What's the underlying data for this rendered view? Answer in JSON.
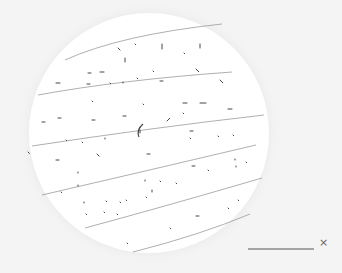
{
  "scene": {
    "background": "#f4f4f4",
    "field": {
      "cx": 149,
      "cy": 133,
      "r": 120,
      "fill": "#ffffff",
      "halo": "#e2e2e2"
    },
    "fibers": [
      {
        "d": "M65 60 Q 120 35 222 24"
      },
      {
        "d": "M38 95 Q 120 80 232 72"
      },
      {
        "d": "M32 146 Q 150 128 264 115"
      },
      {
        "d": "M42 195 Q 150 170 256 145"
      },
      {
        "d": "M85 228 Q 170 205 262 178"
      },
      {
        "d": "M133 252 Q 200 235 250 214"
      }
    ],
    "fiber_color": "#9a9a9a",
    "specks": [
      [
        118,
        48,
        3,
        1
      ],
      [
        135,
        44,
        1,
        1
      ],
      [
        162,
        44,
        5,
        2
      ],
      [
        200,
        44,
        4,
        2
      ],
      [
        125,
        58,
        4,
        2
      ],
      [
        184,
        53,
        1,
        1
      ],
      [
        196,
        69,
        4,
        1
      ],
      [
        88,
        73,
        3,
        0
      ],
      [
        100,
        72,
        4,
        0
      ],
      [
        153,
        71,
        1,
        1
      ],
      [
        56,
        83,
        4,
        0
      ],
      [
        87,
        84,
        3,
        0
      ],
      [
        110,
        83,
        1,
        1
      ],
      [
        123,
        82,
        1,
        2
      ],
      [
        137,
        78,
        1,
        1
      ],
      [
        160,
        81,
        3,
        0
      ],
      [
        220,
        80,
        4,
        1
      ],
      [
        92,
        101,
        1,
        1
      ],
      [
        143,
        104,
        1,
        1
      ],
      [
        183,
        103,
        4,
        0
      ],
      [
        200,
        103,
        6,
        0
      ],
      [
        228,
        109,
        4,
        0
      ],
      [
        42,
        122,
        3,
        0
      ],
      [
        58,
        118,
        3,
        0
      ],
      [
        92,
        120,
        3,
        0
      ],
      [
        123,
        116,
        3,
        0
      ],
      [
        183,
        113,
        1,
        1
      ],
      [
        167,
        121,
        4,
        -1
      ],
      [
        140,
        130,
        3,
        2
      ],
      [
        105,
        138,
        1,
        2
      ],
      [
        66,
        140,
        1,
        1
      ],
      [
        82,
        142,
        1,
        1
      ],
      [
        190,
        131,
        3,
        0
      ],
      [
        190,
        138,
        1,
        1
      ],
      [
        218,
        136,
        1,
        1
      ],
      [
        233,
        135,
        1,
        1
      ],
      [
        28,
        152,
        2,
        1
      ],
      [
        97,
        154,
        3,
        1
      ],
      [
        147,
        154,
        3,
        0
      ],
      [
        56,
        160,
        3,
        0
      ],
      [
        192,
        166,
        3,
        0
      ],
      [
        208,
        170,
        1,
        1
      ],
      [
        235,
        159,
        1,
        2
      ],
      [
        236,
        166,
        1,
        2
      ],
      [
        246,
        162,
        1,
        1
      ],
      [
        78,
        172,
        1,
        2
      ],
      [
        78,
        185,
        1,
        2
      ],
      [
        145,
        180,
        1,
        2
      ],
      [
        160,
        181,
        1,
        1
      ],
      [
        176,
        183,
        1,
        1
      ],
      [
        61,
        192,
        1,
        1
      ],
      [
        152,
        190,
        2,
        2
      ],
      [
        146,
        197,
        1,
        1
      ],
      [
        84,
        202,
        1,
        2
      ],
      [
        106,
        201,
        1,
        1
      ],
      [
        120,
        202,
        1,
        1
      ],
      [
        126,
        200,
        1,
        1
      ],
      [
        104,
        212,
        1,
        1
      ],
      [
        117,
        214,
        1,
        1
      ],
      [
        86,
        214,
        1,
        1
      ],
      [
        196,
        216,
        3,
        0
      ],
      [
        228,
        208,
        1,
        1
      ],
      [
        238,
        200,
        1,
        1
      ],
      [
        170,
        228,
        1,
        1
      ],
      [
        127,
        243,
        1,
        1
      ]
    ],
    "speck_color": "#444444",
    "curl": {
      "d": "M143 124 Q 136 130 139 137"
    }
  },
  "scale_bar": {
    "x1": 248,
    "x2": 314,
    "y": 249,
    "color": "#555555",
    "label": "×"
  }
}
